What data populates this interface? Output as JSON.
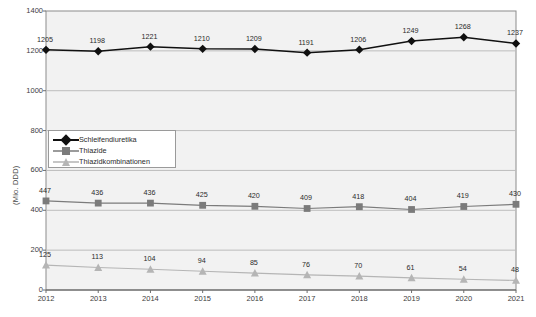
{
  "chart_data": {
    "type": "line",
    "title": "",
    "xlabel": "",
    "ylabel": "(Mio. DDD)",
    "categories": [
      "2012",
      "2013",
      "2014",
      "2015",
      "2016",
      "2017",
      "2018",
      "2019",
      "2020",
      "2021"
    ],
    "ylim": [
      0,
      1400
    ],
    "yticks": [
      0,
      200,
      400,
      600,
      800,
      1000,
      1200,
      1400
    ],
    "ytick_labels": [
      "0",
      "200",
      "400",
      "600",
      "800",
      "1000",
      "1200",
      "1400"
    ],
    "grid": true,
    "legend_position": "inside-upper-left",
    "series": [
      {
        "name": "Schleifendiuretika",
        "marker": "diamond",
        "color": "#101010",
        "values": [
          1205,
          1198,
          1221,
          1210,
          1209,
          1191,
          1206,
          1249,
          1268,
          1237
        ]
      },
      {
        "name": "Thiazide",
        "marker": "square",
        "color": "#7b7b7b",
        "values": [
          447,
          436,
          436,
          425,
          420,
          409,
          418,
          404,
          419,
          430
        ]
      },
      {
        "name": "Thiazidkombinationen",
        "marker": "triangle",
        "color": "#b5b5b5",
        "values": [
          125,
          113,
          104,
          94,
          85,
          76,
          70,
          61,
          54,
          48
        ]
      }
    ]
  },
  "colors": {
    "plot_background": "#f2f2f2",
    "plot_border": "#8c8c8c",
    "gridline": "#bdbdbd",
    "series_1": "#101010",
    "series_2": "#7b7b7b",
    "series_3": "#b5b5b5",
    "legend_border": "#9a9a9a",
    "text": "#2b2b2b"
  },
  "caption": ""
}
